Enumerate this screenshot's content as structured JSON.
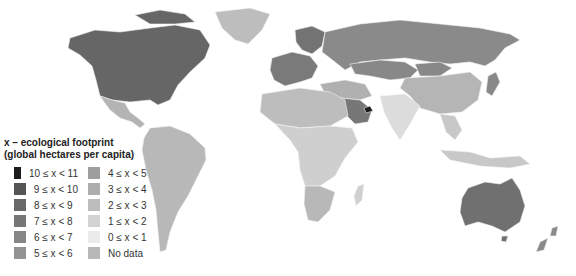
{
  "legend": {
    "title_line1": "x – ecological footprint",
    "title_line2": "(global hectares per capita)",
    "items": [
      {
        "label": "10 ≤ x < 11",
        "color": "#1c1c1c"
      },
      {
        "label": "9 ≤ x < 10",
        "color": "#555555"
      },
      {
        "label": "8 ≤ x < 9",
        "color": "#686868"
      },
      {
        "label": "7 ≤ x < 8",
        "color": "#777777"
      },
      {
        "label": "6 ≤ x < 7",
        "color": "#858585"
      },
      {
        "label": "5 ≤ x < 6",
        "color": "#939393"
      },
      {
        "label": "4 ≤ x < 5",
        "color": "#9e9e9e"
      },
      {
        "label": "3 ≤ x < 4",
        "color": "#adadad"
      },
      {
        "label": "2 ≤ x < 3",
        "color": "#bdbdbd"
      },
      {
        "label": "1 ≤ x < 2",
        "color": "#d2d2d2"
      },
      {
        "label": "0 ≤ x < 1",
        "color": "#ebebeb"
      },
      {
        "label": "No data",
        "color": "#b8b8b8"
      }
    ]
  },
  "regions": {
    "north_america": "#666666",
    "greenland": "#bdbdbd",
    "mexico_central_america": "#b4b4b4",
    "south_america": "#b8b8b8",
    "europe_west": "#7a7a7a",
    "scandinavia": "#737373",
    "russia": "#8a8a8a",
    "kazakhstan_mongolia": "#888888",
    "middle_east": "#b0b0b0",
    "saudi_arabia": "#777777",
    "uae": "#1c1c1c",
    "africa_north": "#bdbdbd",
    "africa_sub_saharan": "#cfcfcf",
    "southern_africa": "#b8b8b8",
    "india": "#dcdcdc",
    "china": "#b5b5b5",
    "southeast_asia": "#c8c8c8",
    "japan": "#888888",
    "australia": "#707070",
    "new_zealand": "#8a8a8a",
    "madagascar": "#d0d0d0"
  }
}
